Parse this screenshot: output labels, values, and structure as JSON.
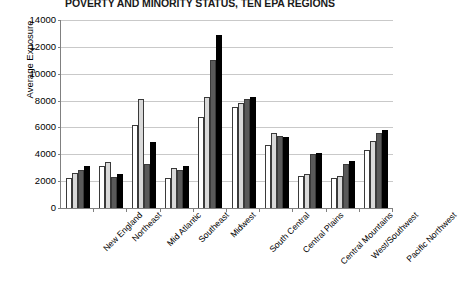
{
  "chart_data": {
    "type": "bar",
    "title": "POVERTY AND MINORITY STATUS, TEN EPA REGIONS",
    "xlabel": "",
    "ylabel": "Average Exposure",
    "ylim": [
      0,
      14000
    ],
    "ytick_step": 2000,
    "yticks": [
      0,
      2000,
      4000,
      6000,
      8000,
      10000,
      12000,
      14000
    ],
    "ytick_labels": [
      "0",
      "2000",
      "4000",
      "6000",
      "8000",
      "10000",
      "12000",
      "14000"
    ],
    "grid": true,
    "legend": "none",
    "categories": [
      "New England",
      "Northeast",
      "Mid Atlantic",
      "Southeast",
      "Midwest",
      "South Central",
      "Central Plains",
      "Central Mountains",
      "West/Southwest",
      "Pacific Northwest"
    ],
    "series": [
      {
        "name": "series-1",
        "color": "#ffffff",
        "values": [
          2250,
          3100,
          6200,
          2200,
          6800,
          7500,
          4700,
          2400,
          2200,
          4300
        ]
      },
      {
        "name": "series-2",
        "color": "#d9d9d9",
        "values": [
          2600,
          3400,
          8100,
          3000,
          8300,
          7800,
          5600,
          2500,
          2400,
          5000
        ]
      },
      {
        "name": "series-3",
        "color": "#5a5a5a",
        "values": [
          2800,
          2300,
          3300,
          2800,
          11000,
          8100,
          5400,
          4000,
          3300,
          5600
        ]
      },
      {
        "name": "series-4",
        "color": "#000000",
        "values": [
          3100,
          2500,
          4900,
          3100,
          12900,
          8300,
          5300,
          4100,
          3500,
          5800
        ]
      }
    ]
  }
}
